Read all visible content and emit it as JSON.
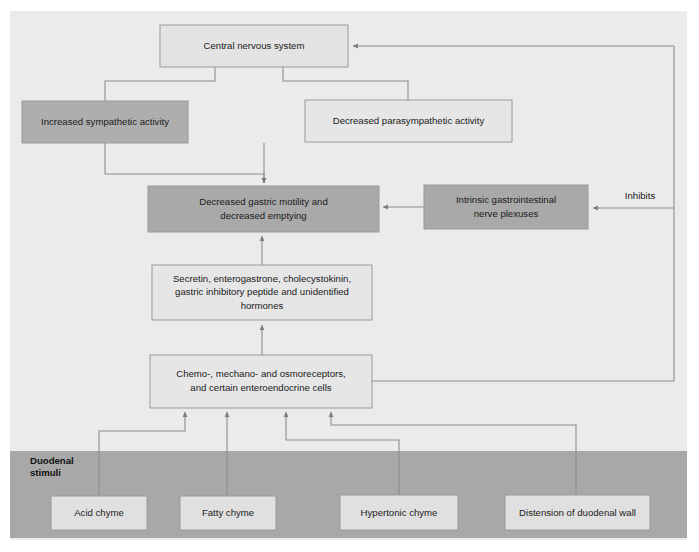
{
  "figure": {
    "panel": {
      "background_color": "#ebebeb",
      "band_color": "#a8a8a8",
      "shaded_node_color": "#a8a8a8",
      "light_node_color": "#e3e3e3",
      "border_color": "#9a9a9a",
      "connector_color": "#8d8d8d"
    },
    "band": {
      "label_line1": "Duodenal",
      "label_line2": "stimuli"
    },
    "nodes": [
      {
        "id": "cns",
        "lines": [
          "Central nervous system"
        ],
        "style": "light",
        "x": 160,
        "y": 25,
        "w": 188,
        "h": 42
      },
      {
        "id": "sympathetic",
        "lines": [
          "Increased sympathetic activity"
        ],
        "style": "shaded",
        "x": 22,
        "y": 101,
        "w": 166,
        "h": 42
      },
      {
        "id": "parasympathetic",
        "lines": [
          "Decreased parasympathetic activity"
        ],
        "style": "light",
        "x": 305,
        "y": 100,
        "w": 207,
        "h": 42
      },
      {
        "id": "gastric-motility",
        "lines": [
          "Decreased gastric motility and",
          "decreased emptying"
        ],
        "style": "shaded",
        "x": 148,
        "y": 186,
        "w": 231,
        "h": 46
      },
      {
        "id": "nerve-plexuses",
        "lines": [
          "Intrinsic gastrointestinal",
          "nerve plexuses"
        ],
        "style": "shaded",
        "x": 424,
        "y": 185,
        "w": 164,
        "h": 44
      },
      {
        "id": "hormones",
        "lines": [
          "Secretin, enterogastrone, cholecystokinin,",
          "gastric inhibitory peptide and unidentified",
          "hormones"
        ],
        "style": "light",
        "x": 152,
        "y": 265,
        "w": 220,
        "h": 55
      },
      {
        "id": "receptors",
        "lines": [
          "Chemo-, mechano- and osmoreceptors,",
          "and certain enteroendocrine cells"
        ],
        "style": "light",
        "x": 150,
        "y": 355,
        "w": 222,
        "h": 53
      },
      {
        "id": "acid-chyme",
        "lines": [
          "Acid chyme"
        ],
        "style": "light",
        "x": 51,
        "y": 496,
        "w": 96,
        "h": 34
      },
      {
        "id": "fatty-chyme",
        "lines": [
          "Fatty chyme"
        ],
        "style": "light",
        "x": 180,
        "y": 496,
        "w": 96,
        "h": 34
      },
      {
        "id": "hypertonic-chyme",
        "lines": [
          "Hypertonic chyme"
        ],
        "style": "light",
        "x": 340,
        "y": 495,
        "w": 118,
        "h": 35
      },
      {
        "id": "distension",
        "lines": [
          "Distension of duodenal wall"
        ],
        "style": "light",
        "x": 505,
        "y": 495,
        "w": 145,
        "h": 35
      }
    ],
    "edge_labels": [
      {
        "id": "inhibits",
        "text": "Inhibits",
        "x": 640,
        "y": 199
      }
    ]
  }
}
